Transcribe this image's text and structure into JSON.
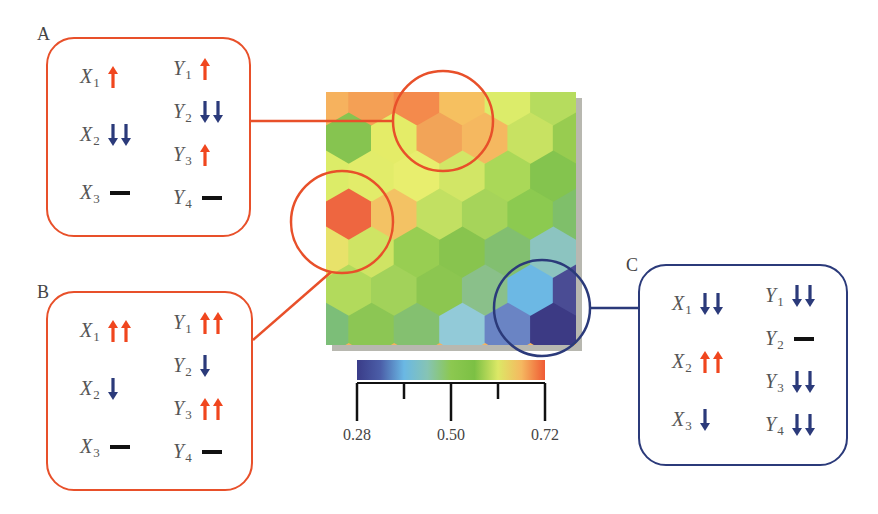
{
  "colors": {
    "up": "#f0461e",
    "down": "#2b3a7a",
    "neutral": "#111111",
    "orange_frame": "#e8502a",
    "blue_frame": "#2b3a7a"
  },
  "panels": [
    {
      "id": "A",
      "letter": "A",
      "frame": "orange",
      "box": {
        "x": 46,
        "y": 37,
        "w": 205,
        "h": 200
      },
      "letter_pos": {
        "x": 37,
        "y": 24
      },
      "left_vars": [
        {
          "name": "X",
          "sub": "1",
          "indicator": "up",
          "count": 1
        },
        {
          "name": "X",
          "sub": "2",
          "indicator": "down",
          "count": 2
        },
        {
          "name": "X",
          "sub": "3",
          "indicator": "neutral",
          "count": 1
        }
      ],
      "right_vars": [
        {
          "name": "Y",
          "sub": "1",
          "indicator": "up",
          "count": 1
        },
        {
          "name": "Y",
          "sub": "2",
          "indicator": "down",
          "count": 2
        },
        {
          "name": "Y",
          "sub": "3",
          "indicator": "up",
          "count": 1
        },
        {
          "name": "Y",
          "sub": "4",
          "indicator": "neutral",
          "count": 1
        }
      ]
    },
    {
      "id": "B",
      "letter": "B",
      "frame": "orange",
      "box": {
        "x": 46,
        "y": 291,
        "w": 207,
        "h": 200
      },
      "letter_pos": {
        "x": 37,
        "y": 282
      },
      "left_vars": [
        {
          "name": "X",
          "sub": "1",
          "indicator": "up",
          "count": 2
        },
        {
          "name": "X",
          "sub": "2",
          "indicator": "down",
          "count": 1
        },
        {
          "name": "X",
          "sub": "3",
          "indicator": "neutral",
          "count": 1
        }
      ],
      "right_vars": [
        {
          "name": "Y",
          "sub": "1",
          "indicator": "up",
          "count": 2
        },
        {
          "name": "Y",
          "sub": "2",
          "indicator": "down",
          "count": 1
        },
        {
          "name": "Y",
          "sub": "3",
          "indicator": "up",
          "count": 2
        },
        {
          "name": "Y",
          "sub": "4",
          "indicator": "neutral",
          "count": 1
        }
      ]
    },
    {
      "id": "C",
      "letter": "C",
      "frame": "blue",
      "box": {
        "x": 638,
        "y": 264,
        "w": 210,
        "h": 202
      },
      "letter_pos": {
        "x": 626,
        "y": 255
      },
      "left_vars": [
        {
          "name": "X",
          "sub": "1",
          "indicator": "down",
          "count": 2
        },
        {
          "name": "X",
          "sub": "2",
          "indicator": "up",
          "count": 2
        },
        {
          "name": "X",
          "sub": "3",
          "indicator": "down",
          "count": 1
        }
      ],
      "right_vars": [
        {
          "name": "Y",
          "sub": "1",
          "indicator": "down",
          "count": 2
        },
        {
          "name": "Y",
          "sub": "2",
          "indicator": "neutral",
          "count": 1
        },
        {
          "name": "Y",
          "sub": "3",
          "indicator": "down",
          "count": 2
        },
        {
          "name": "Y",
          "sub": "4",
          "indicator": "down",
          "count": 2
        }
      ]
    }
  ],
  "map": {
    "x": 326,
    "y": 92,
    "w": 250,
    "h": 253,
    "shadow_color": "#b8b8b0",
    "hex_rows": [
      [
        "#f6b25e",
        "#f4a055",
        "#f48a4c",
        "#f6c060",
        "#dcec6a",
        "#b6dc5e"
      ],
      [
        "#86c450",
        "#e4ec68",
        "#f2a458",
        "#f5b860",
        "#c8e262",
        "#98cc50"
      ],
      [
        "#dcec68",
        "#e2ec6a",
        "#e8ee6e",
        "#d2e666",
        "#aad858",
        "#84c44e"
      ],
      [
        "#ee6640",
        "#f3c264",
        "#c2e062",
        "#a6d45a",
        "#8cca50",
        "#7fbf6a"
      ],
      [
        "#e8e26a",
        "#cfe464",
        "#98ce52",
        "#88c44e",
        "#82bf70",
        "#8cc4c0"
      ],
      [
        "#b2da5c",
        "#a2d25a",
        "#8cc650",
        "#8ac08a",
        "#6cb8e4",
        "#4a4c94"
      ],
      [
        "#7cbe78",
        "#8cc654",
        "#84c070",
        "#92cad8",
        "#6a84c4",
        "#3c3a84"
      ]
    ],
    "circles": [
      {
        "id": "A",
        "cx": 443,
        "cy": 121,
        "r": 50,
        "color": "#e8502a"
      },
      {
        "id": "B",
        "cx": 342,
        "cy": 222,
        "r": 51,
        "color": "#e8502a"
      },
      {
        "id": "C",
        "cx": 542,
        "cy": 308,
        "r": 48,
        "color": "#2b3a7a"
      }
    ],
    "connectors": [
      {
        "from": "A",
        "x1": 251,
        "y1": 121,
        "x2": 393,
        "y2": 121,
        "color": "#e8502a"
      },
      {
        "from": "B",
        "x1": 253,
        "y1": 340,
        "x2": 331,
        "y2": 272,
        "color": "#e8502a"
      },
      {
        "from": "C",
        "x1": 590,
        "y1": 308,
        "x2": 638,
        "y2": 308,
        "color": "#2b3a7a"
      }
    ]
  },
  "colorbar": {
    "x": 357,
    "y": 360,
    "w": 188,
    "h": 20,
    "stops": [
      "#3a3c88",
      "#4b5ea8",
      "#6ab8e4",
      "#86c4b4",
      "#8cc850",
      "#7cc044",
      "#dce866",
      "#f5b860",
      "#ef5a34"
    ],
    "ticks_y": 383,
    "major_tick_len": 38,
    "minor_tick_len": 16
  },
  "chart_data": {
    "type": "heatmap",
    "title": "",
    "colorbar": {
      "min": 0.28,
      "max": 0.72,
      "tick_labels": [
        "0.28",
        "0.50",
        "0.72"
      ],
      "tick_values": [
        0.28,
        0.39,
        0.5,
        0.61,
        0.72
      ],
      "colormap": "blue-cyan-green-yellow-orange-red"
    },
    "regions": [
      {
        "label": "A",
        "location": "top-center",
        "value_approx": 0.68,
        "indicators": {
          "X1": "up",
          "X2": "down-down",
          "X3": "neutral",
          "Y1": "up",
          "Y2": "down-down",
          "Y3": "up",
          "Y4": "neutral"
        }
      },
      {
        "label": "B",
        "location": "left-middle",
        "value_approx": 0.7,
        "indicators": {
          "X1": "up-up",
          "X2": "down",
          "X3": "neutral",
          "Y1": "up-up",
          "Y2": "down",
          "Y3": "up-up",
          "Y4": "neutral"
        }
      },
      {
        "label": "C",
        "location": "bottom-right",
        "value_approx": 0.3,
        "indicators": {
          "X1": "down-down",
          "X2": "up-up",
          "X3": "down",
          "Y1": "down-down",
          "Y2": "neutral",
          "Y3": "down-down",
          "Y4": "down-down"
        }
      }
    ]
  }
}
